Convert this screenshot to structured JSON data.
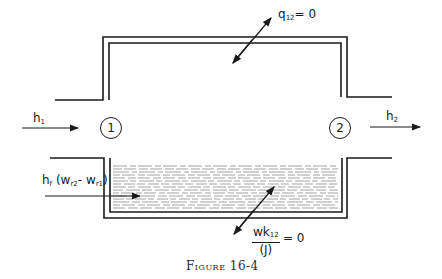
{
  "figure": {
    "caption": "Figure 16-4",
    "labels": {
      "heat": {
        "base": "q",
        "sub": "12",
        "rest": "= 0"
      },
      "work": {
        "num_base": "wk",
        "num_sub": "12",
        "den": "(J)",
        "rest": "= 0"
      },
      "h_in": {
        "base": "h",
        "sub": "1"
      },
      "h_out": {
        "base": "h",
        "sub": "2"
      },
      "liquid_inflow": {
        "base": "h",
        "sub": "f",
        "open": "(w",
        "s1": "r2",
        "mid": "- w",
        "s2": "r1",
        "close": ")"
      },
      "state1": "1",
      "state2": "2"
    },
    "colors": {
      "line": "#1a1a1a",
      "background": "#ffffff"
    }
  }
}
